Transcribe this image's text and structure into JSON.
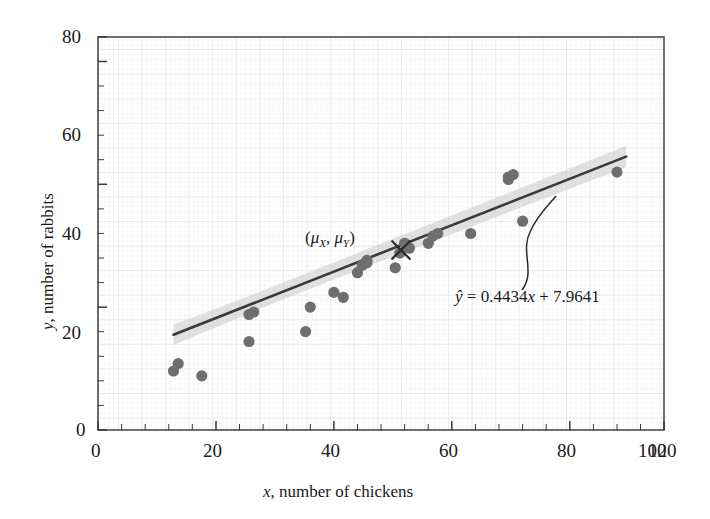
{
  "chart_data": {
    "type": "scatter",
    "title": "",
    "xlabel": "x, number of chickens",
    "ylabel": "y, number of rabbits",
    "xlim": [
      0,
      120
    ],
    "ylim": [
      0,
      80
    ],
    "xticks": [
      0,
      20,
      40,
      60,
      80,
      100,
      120
    ],
    "yticks": [
      0,
      20,
      40,
      60,
      80
    ],
    "x_minor_step": 5,
    "y_minor_step": 5,
    "grid": true,
    "legend": "none",
    "x": [
      16,
      17,
      22,
      32,
      32,
      33,
      44,
      45,
      50,
      52,
      55,
      56,
      57,
      57,
      63,
      64,
      65,
      66,
      70,
      71,
      72,
      79,
      87,
      87,
      88,
      90,
      110
    ],
    "y": [
      12,
      13.5,
      11,
      18,
      23.5,
      24,
      20,
      25,
      28,
      27,
      32,
      33.5,
      34,
      34.5,
      33,
      36,
      38,
      37,
      38,
      39.5,
      40,
      40,
      51.5,
      52,
      52.5,
      43,
      53
    ],
    "point_color": "#6e6e6e",
    "point_size": 6,
    "regression": {
      "equation_label": "ŷ = 0.4434x + 7.9641",
      "slope": 0.4434,
      "intercept": 7.9641,
      "x_start": 16,
      "x_end": 112,
      "line_color": "#3a3a3a"
    },
    "confidence_band": {
      "label": "",
      "fill_color": "#c9c9c9",
      "half_width_at_ends": 4.2,
      "half_width_at_center": 1.6
    },
    "centroid": {
      "label": "(μX, μY)",
      "x": 64,
      "y": 36.4,
      "marker": "x-cross"
    },
    "annotations": [
      {
        "name": "regression-equation",
        "text_y_hat": "ŷ",
        "text_equals": " = ",
        "text_rhs": "0.4434",
        "text_x_var": "x",
        "text_tail": " + 7.9641",
        "leader_line": "curved"
      },
      {
        "name": "centroid-label",
        "text_open": "(",
        "mu_x": "μ",
        "sub_x": "X",
        "comma": ", ",
        "mu_y": "μ",
        "sub_y": "Y",
        "text_close": ")"
      }
    ]
  },
  "axis": {
    "x_tick_labels": [
      "0",
      "20",
      "40",
      "60",
      "80",
      "100",
      "120"
    ],
    "y_tick_labels": [
      "0",
      "20",
      "40",
      "60",
      "80"
    ],
    "x_title_var": "x",
    "x_title_rest": ", number of chickens",
    "y_title_var": "y",
    "y_title_rest": ", number of rabbits"
  },
  "colors": {
    "background": "#ffffff",
    "frame": "#4a4a4a",
    "grid_minor": "#e8e8ea",
    "grid_major": "#d8d8dc",
    "point": "#6e6e6e",
    "line": "#3a3a3a",
    "band": "#c9c9c9",
    "text": "#1a1a1a"
  }
}
